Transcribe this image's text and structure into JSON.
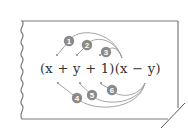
{
  "diagram": {
    "expression": "(x + y + 1)(x − y)",
    "expression_parts": {
      "left_factor": "(x + y + 1)",
      "right_factor": "(x − y)"
    },
    "steps": [
      {
        "label": "1",
        "from": "x",
        "to": "x"
      },
      {
        "label": "2",
        "from": "y",
        "to": "x"
      },
      {
        "label": "3",
        "from": "1",
        "to": "x"
      },
      {
        "label": "4",
        "from": "x",
        "to": "−y"
      },
      {
        "label": "5",
        "from": "y",
        "to": "−y"
      },
      {
        "label": "6",
        "from": "1",
        "to": "−y"
      }
    ],
    "colors": {
      "badge": "#8a8a8a",
      "badge_text": "#ffffff",
      "arrow": "#9a9a9a",
      "card_border": "#7a7a7a",
      "text": "#333333"
    }
  }
}
